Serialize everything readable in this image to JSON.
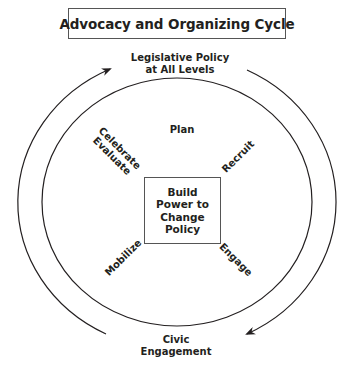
{
  "title": "Advocacy and Organizing Cycle",
  "outer_cycle": {
    "top_label_line1": "Legislative Policy",
    "top_label_line2": "at All Levels",
    "bottom_label_line1": "Civic",
    "bottom_label_line2": "Engagement"
  },
  "inner_cycle": {
    "steps": [
      {
        "label": "Plan"
      },
      {
        "label": "Recruit"
      },
      {
        "label": "Engage"
      },
      {
        "label": "Mobilize"
      },
      {
        "label_line1": "Celebrate",
        "label_line2": "Evaluate"
      }
    ]
  },
  "center": {
    "lines": [
      "Build",
      "Power to",
      "Change",
      "Policy"
    ]
  },
  "colors": {
    "stroke": "#231f20",
    "background": "#ffffff"
  }
}
